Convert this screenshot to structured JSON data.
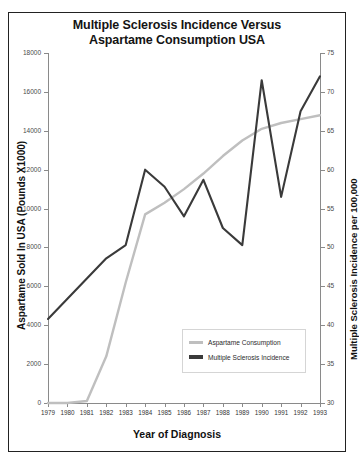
{
  "figure": {
    "title_line1": "Multiple Sclerosis Incidence Versus",
    "title_line2": "Aspartame Consumption USA",
    "top_artifact": "•"
  },
  "legend": {
    "items": [
      {
        "label": "Aspartame Consumption",
        "color": "#bfbfbf"
      },
      {
        "label": "Multiple Sclerosis Incidence",
        "color": "#3a3a3a"
      }
    ]
  },
  "chart_data": {
    "type": "line",
    "title": "Multiple Sclerosis Incidence Versus Aspartame Consumption USA",
    "xlabel": "Year of Diagnosis",
    "ylabel": "Aspartame Sold In USA  (Pounds X1000)",
    "y2label": "Multiple Sclerosis Incidence  per 100,000",
    "grid": false,
    "legend_position": "lower-right-inside",
    "categories": [
      1979,
      1980,
      1981,
      1982,
      1983,
      1984,
      1985,
      1986,
      1987,
      1988,
      1989,
      1990,
      1991,
      1992,
      1993
    ],
    "xticklabels": [
      "1979",
      "1980",
      "1981",
      "1982",
      "1983",
      "1984",
      "1985",
      "1986",
      "1987",
      "1988",
      "1989",
      "1990",
      "1991",
      "1992",
      "1993"
    ],
    "ylim": [
      0,
      18000
    ],
    "yticks": [
      0,
      2000,
      4000,
      6000,
      8000,
      10000,
      12000,
      14000,
      16000,
      18000
    ],
    "yticklabels": [
      "0",
      "2000",
      "4000",
      "6000",
      "8000",
      "10000",
      "12000",
      "14000",
      "16000",
      "18000"
    ],
    "y2lim": [
      30,
      75
    ],
    "y2ticks": [
      30,
      35,
      40,
      45,
      50,
      55,
      60,
      65,
      70,
      75
    ],
    "y2ticklabels": [
      "30",
      "35",
      "40",
      "45",
      "50",
      "55",
      "60",
      "65",
      "70",
      "75"
    ],
    "series": [
      {
        "name": "Aspartame Consumption",
        "axis": "left",
        "color": "#bfbfbf",
        "units": "Pounds X1000",
        "values": [
          0,
          0,
          100,
          2400,
          6200,
          9700,
          10300,
          11000,
          11800,
          12700,
          13500,
          14100,
          14400,
          14600,
          14800
        ]
      },
      {
        "name": "Multiple Sclerosis Incidence",
        "axis": "right",
        "color": "#3a3a3a",
        "units": "per 100,000",
        "values": [
          40.8,
          43.4,
          46.0,
          48.6,
          50.3,
          60.0,
          57.8,
          54.0,
          58.7,
          52.5,
          50.3,
          71.5,
          56.5,
          67.5,
          72.0
        ]
      }
    ]
  }
}
